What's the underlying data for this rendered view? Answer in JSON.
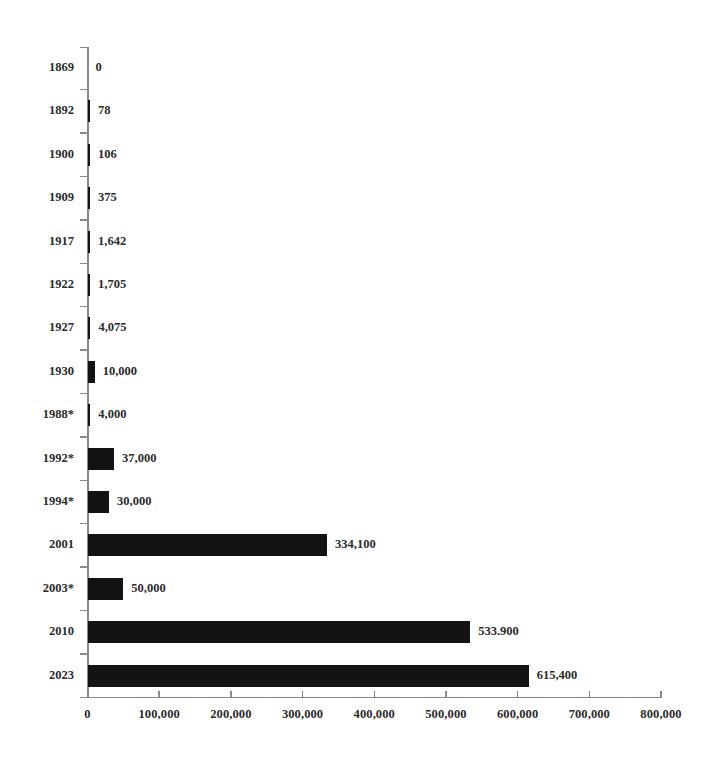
{
  "chart_data": {
    "type": "bar",
    "orientation": "horizontal",
    "title": "",
    "subtitle": "",
    "xlabel": "",
    "ylabel": "",
    "xlim": [
      0,
      800000
    ],
    "ylim": null,
    "grid": false,
    "legend": null,
    "bar_color": "#131313",
    "axis_color": "#8a8a8a",
    "x_ticks": [
      {
        "value": 0,
        "label": "0"
      },
      {
        "value": 100000,
        "label": "100,000"
      },
      {
        "value": 200000,
        "label": "200,000"
      },
      {
        "value": 300000,
        "label": "300,000"
      },
      {
        "value": 400000,
        "label": "400,000"
      },
      {
        "value": 500000,
        "label": "500,000"
      },
      {
        "value": 600000,
        "label": "600,000"
      },
      {
        "value": 700000,
        "label": "700,000"
      },
      {
        "value": 800000,
        "label": "800,000"
      }
    ],
    "categories": [
      "1869",
      "1892",
      "1900",
      "1909",
      "1917",
      "1922",
      "1927",
      "1930",
      "1988*",
      "1992*",
      "1994*",
      "2001",
      "2003*",
      "2010",
      "2023"
    ],
    "values": [
      0,
      78,
      106,
      375,
      1642,
      1705,
      4075,
      10000,
      4000,
      37000,
      30000,
      334100,
      50000,
      533900,
      615400
    ],
    "data_labels": [
      "0",
      "78",
      "106",
      "375",
      "1,642",
      "1,705",
      "4,075",
      "10,000",
      "4,000",
      "37,000",
      "30,000",
      "334,100",
      "50,000",
      "533.900",
      "615,400"
    ],
    "rows": [
      {
        "category": "1869",
        "value": 0,
        "label": "0"
      },
      {
        "category": "1892",
        "value": 78,
        "label": "78"
      },
      {
        "category": "1900",
        "value": 106,
        "label": "106"
      },
      {
        "category": "1909",
        "value": 375,
        "label": "375"
      },
      {
        "category": "1917",
        "value": 1642,
        "label": "1,642"
      },
      {
        "category": "1922",
        "value": 1705,
        "label": "1,705"
      },
      {
        "category": "1927",
        "value": 4075,
        "label": "4,075"
      },
      {
        "category": "1930",
        "value": 10000,
        "label": "10,000"
      },
      {
        "category": "1988*",
        "value": 4000,
        "label": "4,000"
      },
      {
        "category": "1992*",
        "value": 37000,
        "label": "37,000"
      },
      {
        "category": "1994*",
        "value": 30000,
        "label": "30,000"
      },
      {
        "category": "2001",
        "value": 334100,
        "label": "334,100"
      },
      {
        "category": "2003*",
        "value": 50000,
        "label": "50,000"
      },
      {
        "category": "2010",
        "value": 533900,
        "label": "533.900"
      },
      {
        "category": "2023",
        "value": 615400,
        "label": "615,400"
      }
    ]
  }
}
